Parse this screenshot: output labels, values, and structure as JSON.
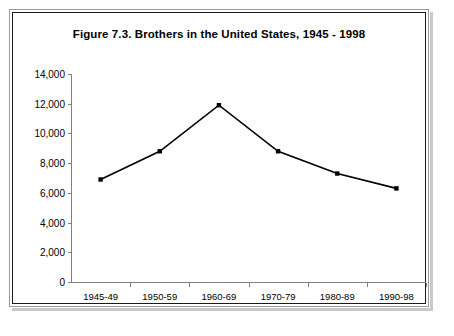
{
  "figure": {
    "title": "Figure 7.3.  Brothers in the United States, 1945 - 1998"
  },
  "chart_data": {
    "type": "line",
    "title": "Figure 7.3.  Brothers in the United States, 1945 - 1998",
    "xlabel": "",
    "ylabel": "",
    "categories": [
      "1945-49",
      "1950-59",
      "1960-69",
      "1970-79",
      "1980-89",
      "1990-98"
    ],
    "values": [
      6900,
      8800,
      11900,
      8800,
      7300,
      6300
    ],
    "ylim": [
      0,
      14000
    ],
    "yticks": [
      0,
      2000,
      4000,
      6000,
      8000,
      10000,
      12000,
      14000
    ],
    "ytick_labels": [
      "0",
      "2,000",
      "4,000",
      "6,000",
      "8,000",
      "10,000",
      "12,000",
      "14,000"
    ],
    "grid": false,
    "legend": null,
    "marker": "square",
    "line_color": "#000000",
    "marker_color": "#000000",
    "axis_color": "#808080"
  }
}
